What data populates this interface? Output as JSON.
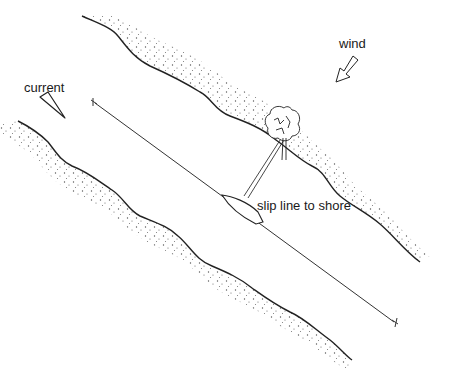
{
  "diagram": {
    "labels": {
      "current": "current",
      "wind": "wind",
      "slip_line": "slip line to shore"
    },
    "colors": {
      "ink": "#222222",
      "stipple": "#555555",
      "background": "#ffffff"
    }
  }
}
